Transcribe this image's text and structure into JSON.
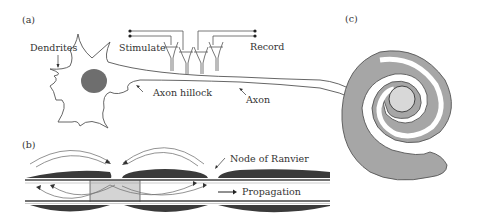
{
  "figure": {
    "panels": [
      {
        "id": "a",
        "label": "(a)"
      },
      {
        "id": "b",
        "label": "(b)"
      },
      {
        "id": "c",
        "label": "(c)"
      }
    ]
  },
  "panel_a": {
    "label": "(a)",
    "annotations": {
      "dendrites": "Dendrites",
      "stimulate": "Stimulate",
      "record": "Record",
      "axon_hillock": "Axon hillock",
      "axon": "Axon"
    },
    "electrode_count": 4
  },
  "panel_b": {
    "label": "(b)",
    "annotations": {
      "node_of_ranvier": "Node of Ranvier",
      "propagation": "Propagation"
    }
  },
  "panel_c": {
    "label": "(c)"
  },
  "colors": {
    "line": "#555555",
    "nucleus": "#6e6e6e",
    "myelin_dark": "#3a3a3a",
    "active_region": "#d4d4d4",
    "spiral_fill": "#a6a6a6",
    "axon_core": "#d8d8d8"
  }
}
